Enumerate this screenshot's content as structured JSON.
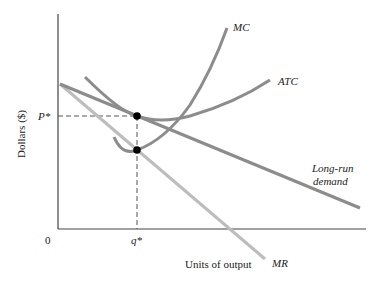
{
  "diagram": {
    "title": "",
    "axes": {
      "ylabel": "Dollars ($)",
      "xlabel": "Units of output",
      "origin": "0",
      "price_tick": "P*",
      "quantity_tick": "q*"
    },
    "curves": [
      {
        "id": "mc",
        "label": "MC",
        "color": "#8c8c8c"
      },
      {
        "id": "atc",
        "label": "ATC",
        "color": "#8c8c8c"
      },
      {
        "id": "demand",
        "label_line1": "Long-run",
        "label_line2": "demand",
        "color": "#8c8c8c"
      },
      {
        "id": "mr",
        "label": "MR",
        "color": "#bdbdbd"
      }
    ],
    "points": [
      {
        "id": "price-tangency",
        "desc": "ATC tangent to long-run demand at P*, q*"
      },
      {
        "id": "mc-mr-intersection",
        "desc": "MC = MR at q*"
      }
    ],
    "colors": {
      "axis": "#444444",
      "curve": "#8c8c8c",
      "mr": "#bdbdbd",
      "dot": "#000000"
    }
  }
}
